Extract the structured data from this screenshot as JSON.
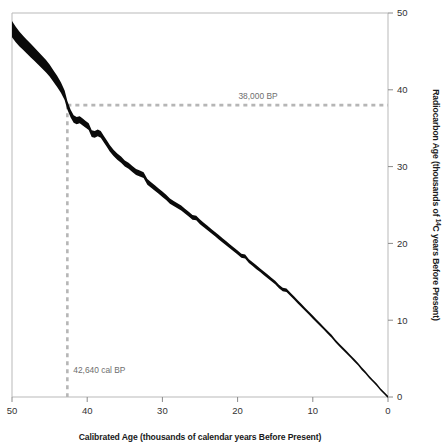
{
  "chart_data": {
    "type": "line",
    "title": "",
    "subtitle": "",
    "xlabel": "Calibrated Age (thousands of calendar years Before Present)",
    "ylabel": "Radiocarbon Age (thousands of <sup>14</sup>C years Before Present)",
    "ylabel_plain": "Radiocarbon Age (thousands of 14C years Before Present)",
    "ylabel_part1": "Radiocarbon Age (thousands of ",
    "ylabel_superscript": "14",
    "ylabel_part2": "C years Before Present)",
    "xlim": [
      50,
      0
    ],
    "ylim": [
      0,
      50
    ],
    "x_reversed": true,
    "y_axis_position": "right",
    "grid": false,
    "legend": null,
    "xticks": [
      50,
      40,
      30,
      20,
      10,
      0
    ],
    "xtick_labels": [
      "50",
      "40",
      "30",
      "20",
      "10",
      "0"
    ],
    "yticks": [
      0,
      10,
      20,
      30,
      40,
      50
    ],
    "ytick_labels": [
      "0",
      "10",
      "20",
      "30",
      "40",
      "50"
    ],
    "series": [
      {
        "name": "Radiocarbon calibration curve",
        "style": "band",
        "color": "#0a0a0a",
        "x": [
          50.0,
          49.5,
          49.0,
          48.5,
          48.0,
          47.5,
          47.0,
          46.5,
          46.0,
          45.5,
          45.0,
          44.5,
          44.0,
          43.5,
          43.0,
          42.64,
          42.2,
          41.8,
          41.4,
          41.0,
          40.6,
          40.2,
          39.8,
          39.4,
          39.0,
          38.6,
          38.2,
          37.8,
          37.4,
          37.0,
          36.5,
          36.0,
          35.5,
          35.0,
          34.5,
          34.0,
          33.5,
          33.0,
          32.5,
          32.0,
          31.5,
          31.0,
          30.5,
          30.0,
          29.5,
          29.0,
          28.5,
          28.0,
          27.5,
          27.0,
          26.5,
          26.0,
          25.5,
          25.0,
          24.5,
          24.0,
          23.5,
          23.0,
          22.5,
          22.0,
          21.5,
          21.0,
          20.5,
          20.0,
          19.5,
          19.0,
          18.5,
          18.0,
          17.5,
          17.0,
          16.5,
          16.0,
          15.5,
          15.0,
          14.5,
          14.0,
          13.5,
          13.0,
          12.5,
          12.0,
          11.5,
          11.0,
          10.5,
          10.0,
          9.5,
          9.0,
          8.5,
          8.0,
          7.5,
          7.0,
          6.5,
          6.0,
          5.5,
          5.0,
          4.5,
          4.0,
          3.5,
          3.0,
          2.5,
          2.0,
          1.5,
          1.0,
          0.5,
          0.0
        ],
        "y": [
          47.9,
          47.2,
          46.6,
          46.1,
          45.6,
          45.1,
          44.6,
          44.1,
          43.6,
          43.1,
          42.5,
          41.8,
          41.1,
          40.3,
          39.3,
          38.0,
          36.9,
          36.2,
          36.0,
          36.1,
          35.8,
          35.5,
          35.2,
          34.3,
          34.2,
          34.4,
          34.2,
          33.6,
          33.0,
          32.4,
          31.8,
          31.3,
          30.9,
          30.4,
          30.1,
          29.7,
          29.3,
          29.1,
          28.9,
          28.0,
          27.6,
          27.2,
          26.8,
          26.4,
          26.0,
          25.5,
          25.2,
          24.9,
          24.6,
          24.2,
          23.8,
          23.4,
          23.3,
          22.8,
          22.4,
          22.0,
          21.6,
          21.2,
          20.8,
          20.4,
          20.0,
          19.6,
          19.2,
          18.8,
          18.4,
          18.3,
          17.7,
          17.3,
          16.9,
          16.5,
          16.1,
          15.7,
          15.3,
          14.9,
          14.4,
          14.0,
          13.9,
          13.4,
          12.9,
          12.4,
          11.9,
          11.4,
          10.9,
          10.4,
          9.9,
          9.4,
          8.9,
          8.4,
          7.9,
          7.3,
          6.8,
          6.3,
          5.8,
          5.3,
          4.8,
          4.3,
          3.7,
          3.2,
          2.6,
          2.1,
          1.6,
          1.0,
          0.5,
          0.0
        ],
        "uncertainty_halfwidth": [
          1.05,
          1.0,
          0.95,
          0.92,
          0.9,
          0.88,
          0.86,
          0.84,
          0.82,
          0.8,
          0.78,
          0.76,
          0.72,
          0.68,
          0.62,
          0.55,
          0.5,
          0.48,
          0.47,
          0.47,
          0.46,
          0.45,
          0.45,
          0.44,
          0.44,
          0.44,
          0.43,
          0.43,
          0.42,
          0.42,
          0.41,
          0.41,
          0.4,
          0.4,
          0.39,
          0.39,
          0.38,
          0.38,
          0.37,
          0.37,
          0.36,
          0.36,
          0.35,
          0.35,
          0.34,
          0.34,
          0.33,
          0.33,
          0.32,
          0.32,
          0.31,
          0.31,
          0.3,
          0.3,
          0.3,
          0.29,
          0.29,
          0.28,
          0.28,
          0.28,
          0.27,
          0.27,
          0.27,
          0.26,
          0.26,
          0.26,
          0.25,
          0.25,
          0.25,
          0.24,
          0.24,
          0.24,
          0.23,
          0.23,
          0.23,
          0.22,
          0.22,
          0.22,
          0.21,
          0.21,
          0.21,
          0.2,
          0.2,
          0.2,
          0.2,
          0.19,
          0.19,
          0.19,
          0.19,
          0.18,
          0.18,
          0.18,
          0.18,
          0.17,
          0.17,
          0.17,
          0.17,
          0.16,
          0.16,
          0.16,
          0.16,
          0.15,
          0.15,
          0.15
        ]
      }
    ],
    "annotations": [
      {
        "name": "radiocarbon-age-guide",
        "label": "38,000 BP",
        "orientation": "horizontal",
        "y": 38.0,
        "x_from": 42.64,
        "x_to": 0,
        "style": "dashed",
        "color": "#b6b6b6"
      },
      {
        "name": "calibrated-age-guide",
        "label": "42,640 cal BP",
        "orientation": "vertical",
        "x": 42.64,
        "y_from": 38.0,
        "y_to": 0,
        "style": "dashed",
        "color": "#b6b6b6"
      }
    ]
  },
  "axes": {
    "x_title": "Calibrated Age (thousands of calendar years Before Present)",
    "y_title_part1": "Radiocarbon Age (thousands of ",
    "y_title_superscript": "14",
    "y_title_part2": "C years Before Present)",
    "x_tick_labels": [
      "50",
      "40",
      "30",
      "20",
      "10",
      "0"
    ],
    "y_tick_labels": [
      "50",
      "40",
      "30",
      "20",
      "10",
      "0"
    ]
  },
  "annotations": {
    "radiocarbon_age": "38,000 BP",
    "calibrated_age": "42,640 cal BP"
  },
  "colors": {
    "curve": "#0a0a0a",
    "guide": "#b6b6b6",
    "frame": "#b9b9b9",
    "tick_text": "#333333",
    "annot_text": "#6e6e6e"
  }
}
